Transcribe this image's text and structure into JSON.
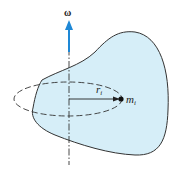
{
  "diagram": {
    "labels": {
      "angular_velocity": "ω",
      "radius": "r",
      "radius_subscript": "i",
      "mass": "m",
      "mass_subscript": "i"
    },
    "colors": {
      "body_fill": "#d6eef8",
      "outline": "#333333",
      "arrow": "#1e88d6",
      "axis": "#333333"
    }
  }
}
